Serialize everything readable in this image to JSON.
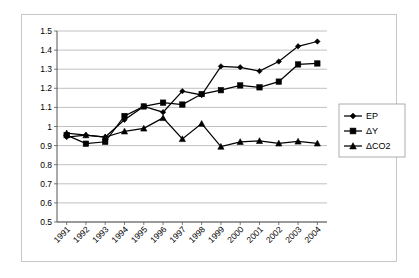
{
  "chart_data": {
    "type": "line",
    "title": "",
    "xlabel": "",
    "ylabel": "",
    "categories": [
      "1991",
      "1992",
      "1993",
      "1994",
      "1995",
      "1996",
      "1997",
      "1998",
      "1999",
      "2000",
      "2001",
      "2002",
      "2003",
      "2004"
    ],
    "ylim": [
      0.5,
      1.5
    ],
    "ytick_step": 0.1,
    "yticks": [
      "0.5",
      "0.6",
      "0.7",
      "0.8",
      "0.9",
      "1",
      "1.1",
      "1.2",
      "1.3",
      "1.4",
      "1.5"
    ],
    "grid": "horizontal",
    "legend_position": "right",
    "series": [
      {
        "name": "EP",
        "marker": "diamond",
        "values": [
          0.945,
          0.955,
          0.945,
          1.035,
          1.105,
          1.075,
          1.185,
          1.165,
          1.315,
          1.31,
          1.29,
          1.34,
          1.42,
          1.445
        ]
      },
      {
        "name": "ΔY",
        "marker": "square",
        "values": [
          0.955,
          0.91,
          0.92,
          1.055,
          1.105,
          1.125,
          1.115,
          1.17,
          1.19,
          1.215,
          1.205,
          1.235,
          1.325,
          1.33
        ]
      },
      {
        "name": "ΔCO2",
        "marker": "triangle",
        "values": [
          0.965,
          0.955,
          0.945,
          0.975,
          0.99,
          1.045,
          0.935,
          1.015,
          0.895,
          0.92,
          0.925,
          0.912,
          0.922,
          0.912
        ]
      }
    ],
    "colors": {
      "series_line": "#000000",
      "marker": "#000000",
      "gridline": "#a6a6a6",
      "axis": "#555555",
      "plot_background": "#ffffff",
      "frame_border": "#c8c8c8"
    }
  }
}
